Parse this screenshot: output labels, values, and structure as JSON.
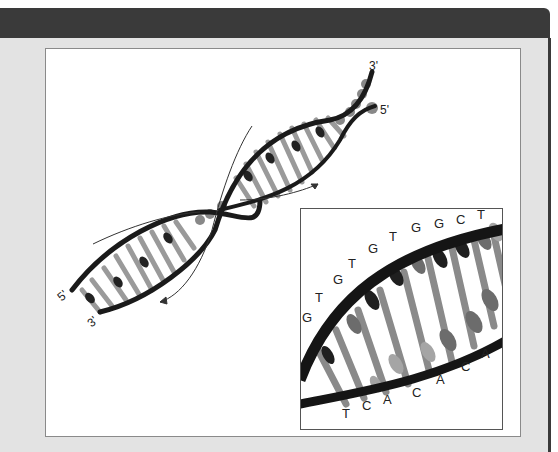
{
  "figure": {
    "main_helix": {
      "top_end_labels": {
        "strand_a": "3'",
        "strand_b": "5'"
      },
      "bottom_end_labels": {
        "strand_a": "5'",
        "strand_b": "3'"
      },
      "arrows": [
        "direction-arrow-upper",
        "direction-arrow-lower"
      ]
    },
    "inset": {
      "upper_strand_sequence": [
        "G",
        "T",
        "G",
        "T",
        "G",
        "T",
        "G",
        "G",
        "C",
        "T"
      ],
      "lower_strand_sequence": [
        "T",
        "C",
        "A",
        "C",
        "A",
        "C",
        "A"
      ]
    }
  }
}
